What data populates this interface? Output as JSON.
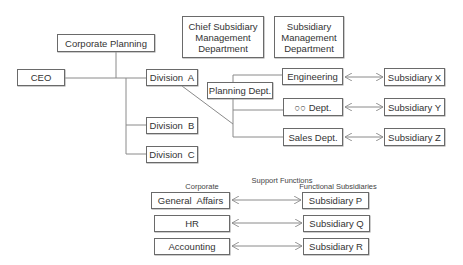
{
  "org": {
    "corporate_planning": "Corporate Planning",
    "ceo": "CEO",
    "division_a": "Division  A",
    "division_b": "Division  B",
    "division_c": "Division  C",
    "chief_subsidiary_mgmt": "Chief Subsidiary Management Department",
    "subsidiary_mgmt": "Subsidiary Management Department",
    "planning_dept": "Planning Dept.",
    "engineering": "Engineering",
    "oo_dept": "○○ Dept.",
    "sales_dept": "Sales Dept.",
    "subsidiary_x": "Subsidiary X",
    "subsidiary_y": "Subsidiary Y",
    "subsidiary_z": "Subsidiary Z"
  },
  "support": {
    "title": "Support Functions",
    "corporate_header": "Corporate",
    "functional_header": "Functional Subsidiaries",
    "corporate": [
      "General  Affairs",
      "HR",
      "Accounting"
    ],
    "subsidiaries": [
      "Subsidiary P",
      "Subsidiary Q",
      "Subsidiary R"
    ]
  },
  "colors": {
    "line": "#8a8a8a",
    "border": "#6a6a6a",
    "text": "#333333"
  }
}
